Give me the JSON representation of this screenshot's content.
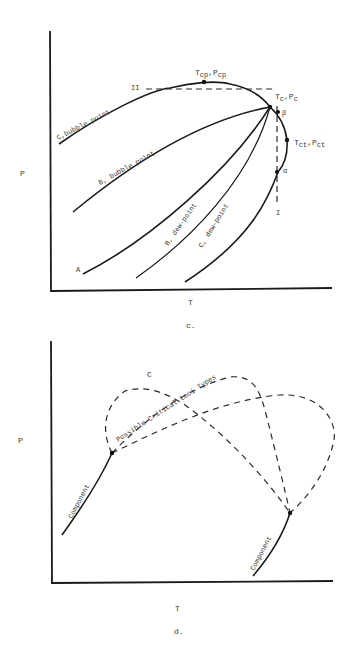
{
  "diagram_c": {
    "caption": "c.",
    "x_axis_label": "T",
    "y_axis_label": "P",
    "labels": {
      "c_bubble": "C,bubble point",
      "b_bubble": "B, bubble point",
      "b_dew": "B, dew-point",
      "c_dew": "C, dew-point",
      "a": "A",
      "cricondenbar_T": "T",
      "cricondenbar_T_sub": "cp",
      "cricondenbar_P": ",P",
      "cricondenbar_P_sub": "cp",
      "critical_T": "T",
      "critical_T_sub": "c",
      "critical_P": ",P",
      "critical_P_sub": "c",
      "cricondentherm_T": "T",
      "cricondentherm_T_sub": "ct",
      "cricondentherm_P": ",P",
      "cricondentherm_P_sub": "ct",
      "beta": "β",
      "alpha": "α",
      "path_I": "I",
      "path_II": "II"
    }
  },
  "diagram_d": {
    "caption": "d.",
    "x_axis_label": "T",
    "y_axis_label": "P",
    "labels": {
      "c": "C",
      "critical_loci": "Possible Critical Loci Types",
      "component_1": "Component",
      "component_2": "Component"
    }
  }
}
